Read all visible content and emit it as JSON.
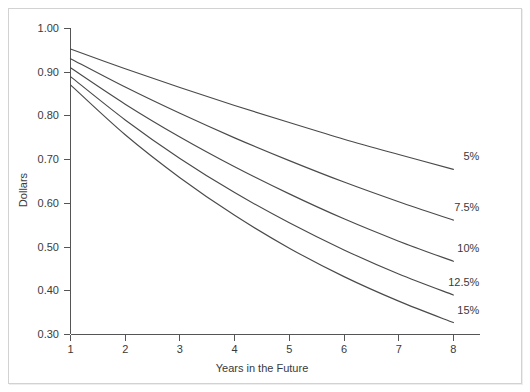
{
  "chart_data": {
    "type": "line",
    "title": "",
    "subtitle": "",
    "xlabel": "Years in the Future",
    "ylabel": "Dollars",
    "xlim": [
      1,
      8
    ],
    "ylim": [
      0.3,
      1.0
    ],
    "grid": false,
    "legend_position": "inline-right-of-curve-ends",
    "x": [
      1,
      2,
      3,
      4,
      5,
      6,
      7,
      8
    ],
    "xticks": [
      "1",
      "2",
      "3",
      "4",
      "5",
      "6",
      "7",
      "8"
    ],
    "yticks": [
      "0.30",
      "0.40",
      "0.50",
      "0.60",
      "0.70",
      "0.80",
      "0.90",
      "1.00"
    ],
    "ytick_values": [
      0.3,
      0.4,
      0.5,
      0.6,
      0.7,
      0.8,
      0.9,
      1.0
    ],
    "series": [
      {
        "name": "5%",
        "rate": 0.05,
        "values": [
          0.952,
          0.907,
          0.864,
          0.823,
          0.784,
          0.746,
          0.711,
          0.677
        ]
      },
      {
        "name": "7.5%",
        "rate": 0.075,
        "values": [
          0.93,
          0.865,
          0.805,
          0.749,
          0.697,
          0.648,
          0.603,
          0.561
        ]
      },
      {
        "name": "10%",
        "rate": 0.1,
        "values": [
          0.909,
          0.826,
          0.751,
          0.683,
          0.621,
          0.564,
          0.513,
          0.467
        ]
      },
      {
        "name": "12.5%",
        "rate": 0.125,
        "values": [
          0.889,
          0.79,
          0.702,
          0.624,
          0.555,
          0.493,
          0.438,
          0.39
        ]
      },
      {
        "name": "15%",
        "rate": 0.15,
        "values": [
          0.87,
          0.756,
          0.658,
          0.572,
          0.497,
          0.432,
          0.376,
          0.327
        ]
      }
    ],
    "annotations": [
      {
        "text": "5%",
        "series": "5%"
      },
      {
        "text": "7.5%",
        "series": "7.5%"
      },
      {
        "text": "10%",
        "series": "10%"
      },
      {
        "text": "12.5%",
        "series": "12.5%"
      },
      {
        "text": "15%",
        "series": "15%"
      }
    ]
  }
}
